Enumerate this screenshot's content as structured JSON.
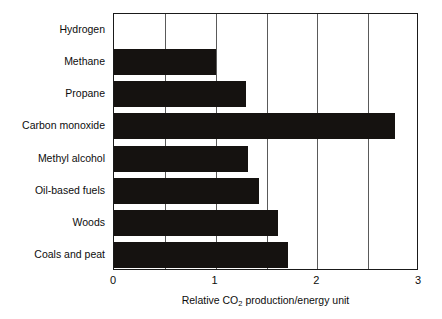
{
  "chart_data": {
    "type": "bar",
    "orientation": "horizontal",
    "title": "",
    "xlabel": "Relative CO2 production/energy unit",
    "xlabel_parts": {
      "before": "Relative CO",
      "subscript": "2",
      "after": " production/energy unit"
    },
    "ylabel": "",
    "categories": [
      "Hydrogen",
      "Methane",
      "Propane",
      "Carbon monoxide",
      "Methyl alcohol",
      "Oil-based fuels",
      "Woods",
      "Coals and peat"
    ],
    "values": [
      0,
      1.0,
      1.3,
      2.76,
      1.32,
      1.43,
      1.61,
      1.71
    ],
    "xlim": [
      0,
      3
    ],
    "xticks": [
      0,
      1,
      2,
      3
    ],
    "xtick_labels": [
      "0",
      "1",
      "2",
      "3"
    ],
    "gridlines_x": [
      0,
      0.5,
      1,
      1.5,
      2,
      2.5,
      3
    ],
    "grid": true,
    "legend": null,
    "bar_color": "#151210",
    "frame_color": "#1a1a1a",
    "grid_color": "#5a5a5a",
    "background_color": "#ffffff"
  }
}
